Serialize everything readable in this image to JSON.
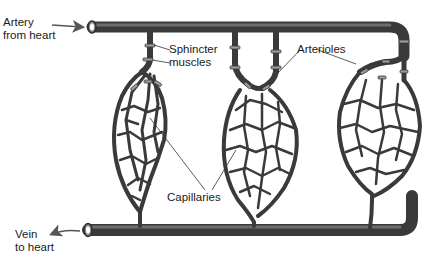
{
  "diagram": {
    "labels": {
      "artery": {
        "line1": "Artery",
        "line2": "from heart"
      },
      "sphincter": {
        "line1": "Sphincter",
        "line2": "muscles"
      },
      "arterioles": {
        "text": "Arterioles"
      },
      "capillaries": {
        "text": "Capillaries"
      },
      "vein": {
        "line1": "Vein",
        "line2": "to heart"
      }
    },
    "colors": {
      "vessel_dark": "#3a3a3a",
      "vessel_mid": "#5e5e5e",
      "vessel_light": "#8a8a8a",
      "sphincter": "#9a9a9a",
      "text": "#1a1a1a",
      "background": "#ffffff"
    }
  }
}
